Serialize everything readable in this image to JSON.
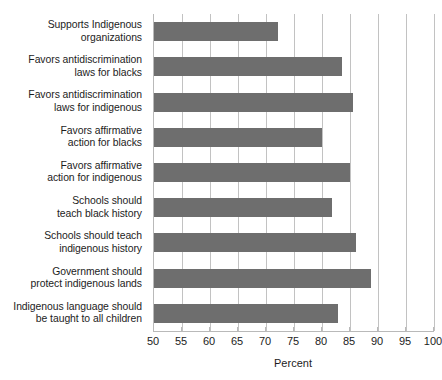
{
  "chart_data": {
    "type": "bar",
    "orientation": "horizontal",
    "title": "",
    "xlabel": "Percent",
    "ylabel": "",
    "xlim": [
      50,
      100
    ],
    "xticks": [
      50,
      55,
      60,
      65,
      70,
      75,
      80,
      85,
      90,
      95,
      100
    ],
    "xtick_labels": [
      "50",
      "55",
      "60",
      "65",
      "70",
      "75",
      "80",
      "85",
      "90",
      "95",
      "100"
    ],
    "grid": "vertical",
    "legend": "none",
    "bar_color": "#6e6e6e",
    "gridline_color": "#c2c2c2",
    "categories": [
      "Supports Indigenous organizations",
      "Favors antidiscrimination laws for blacks",
      "Favors antidiscrimination laws for indigenous",
      "Favors affirmative action for blacks",
      "Favors affirmative action for indigenous",
      "Schools should teach black history",
      "Schools should teach indigenous history",
      "Government should protect indigenous lands",
      "Indigenous language should be taught to all children"
    ],
    "category_lines": [
      [
        "Supports Indigenous",
        "organizations"
      ],
      [
        "Favors antidiscrimination",
        "laws for blacks"
      ],
      [
        "Favors antidiscrimination",
        "laws for indigenous"
      ],
      [
        "Favors affirmative",
        "action for blacks"
      ],
      [
        "Favors affirmative",
        "action for indigenous"
      ],
      [
        "Schools should",
        "teach black history"
      ],
      [
        "Schools should teach",
        "indigenous history"
      ],
      [
        "Government should",
        "protect indigenous lands"
      ],
      [
        "Indigenous language should",
        "be taught to all children"
      ]
    ],
    "values": [
      72.2,
      83.5,
      85.5,
      80.0,
      85.0,
      81.8,
      86.0,
      88.8,
      82.8
    ]
  }
}
